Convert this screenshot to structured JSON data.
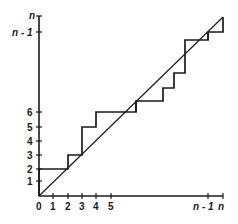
{
  "diagram": {
    "colors": {
      "line": "#1a1a1a",
      "background": "#ffffff"
    },
    "x_axis": {
      "tick_labels": [
        "0",
        "1",
        "2",
        "3",
        "4",
        "5",
        "n - 1",
        "n"
      ]
    },
    "y_axis": {
      "tick_labels": [
        "1",
        "2",
        "3",
        "4",
        "5",
        "6",
        "n - 1",
        "n"
      ]
    },
    "diagonal": {
      "from": [
        0,
        0
      ],
      "to": [
        "n",
        "n"
      ]
    },
    "staircase_steps_visible": [
      {
        "x": 0,
        "y": 2
      },
      {
        "x": 2,
        "y": 3
      },
      {
        "x": 3,
        "y": 5
      },
      {
        "x": 4,
        "y": 6
      },
      {
        "x": "n-1",
        "y": "n"
      }
    ]
  }
}
